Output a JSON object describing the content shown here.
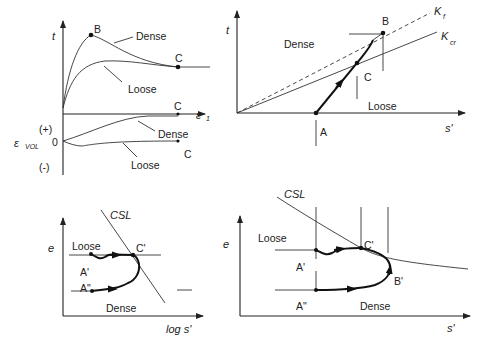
{
  "figure": {
    "panels": [
      {
        "id": "stress-strain",
        "y_axis_label": "t",
        "x_axis_label": "ε",
        "x_axis_sub": "1",
        "points": {
          "peak": "B",
          "critical": "C",
          "critical_axis": "C"
        },
        "curves": {
          "dense": "Dense",
          "loose": "Loose"
        }
      },
      {
        "id": "volumetric-strain",
        "y_axis_label": "ε",
        "y_axis_sub": "VOL",
        "ticks": {
          "plus": "(+)",
          "zero": "0",
          "minus": "(-)"
        },
        "curves": {
          "dense": "Dense",
          "loose": "Loose"
        },
        "points": {
          "critical": "C"
        }
      },
      {
        "id": "stress-path",
        "y_axis_label": "t",
        "x_axis_label": "s'",
        "lines": {
          "kf": "K",
          "kf_sub": "f",
          "kcr": "K",
          "kcr_sub": "cr"
        },
        "regions": {
          "dense": "Dense",
          "loose": "Loose"
        },
        "points": {
          "start": "A",
          "peak": "B",
          "critical": "C"
        }
      },
      {
        "id": "e-log-s",
        "y_axis_label": "e",
        "x_axis_label": "log s'",
        "line_label": "CSL",
        "regions": {
          "loose": "Loose",
          "dense": "Dense"
        },
        "points": {
          "loose_start": "A'",
          "dense_start": "A\"",
          "critical": "C'"
        }
      },
      {
        "id": "e-s",
        "y_axis_label": "e",
        "x_axis_label": "s'",
        "line_label": "CSL",
        "regions": {
          "loose": "Loose",
          "dense": "Dense"
        },
        "points": {
          "loose_start": "A'",
          "dense_start": "A\"",
          "critical": "C'",
          "peak": "B'"
        }
      }
    ]
  }
}
